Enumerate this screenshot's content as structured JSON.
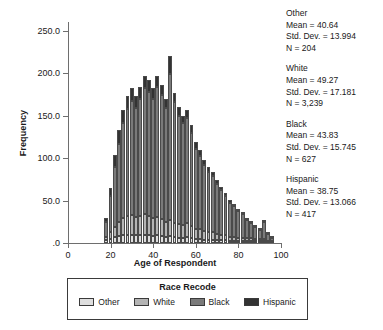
{
  "chart_data": {
    "type": "bar",
    "subtype": "stacked-histogram",
    "title": "",
    "xlabel": "Age of Respondent",
    "ylabel": "Frequency",
    "xlim": [
      0,
      100
    ],
    "ylim": [
      0,
      260
    ],
    "grid": false,
    "legend_position": "bottom",
    "legend_title": "Race Recode",
    "xticks": [
      "0",
      "20",
      "40",
      "60",
      "80",
      "100"
    ],
    "xtick_values": [
      0,
      20,
      40,
      60,
      80,
      100
    ],
    "yticks": [
      ".0",
      "50.0",
      "100.0",
      "150.0",
      "200.0",
      "250.0"
    ],
    "ytick_values": [
      0,
      50,
      100,
      150,
      200,
      250
    ],
    "series_order": [
      "Other",
      "White",
      "Black",
      "Hispanic"
    ],
    "series": [
      {
        "name": "Other",
        "color": "#dedede",
        "values": [
          3,
          5,
          7,
          8,
          9,
          10,
          10,
          9,
          9,
          10,
          9,
          8,
          9,
          8,
          7,
          8,
          7,
          6,
          6,
          7,
          6,
          5,
          5,
          4,
          4,
          4,
          3,
          3,
          3,
          2,
          2,
          2,
          2,
          1,
          1,
          1,
          1,
          1,
          0,
          0
        ]
      },
      {
        "name": "White",
        "color": "#b4b4b4",
        "values": [
          4,
          8,
          12,
          17,
          20,
          22,
          23,
          22,
          23,
          24,
          23,
          21,
          22,
          20,
          18,
          19,
          17,
          16,
          15,
          16,
          14,
          12,
          11,
          10,
          9,
          9,
          8,
          7,
          6,
          5,
          5,
          4,
          4,
          3,
          3,
          2,
          2,
          2,
          1,
          1
        ]
      },
      {
        "name": "Black",
        "color": "#7a7a7a",
        "values": [
          18,
          42,
          70,
          92,
          112,
          126,
          134,
          128,
          138,
          148,
          146,
          140,
          152,
          146,
          134,
          172,
          142,
          128,
          120,
          124,
          110,
          94,
          86,
          78,
          70,
          66,
          58,
          52,
          46,
          40,
          36,
          31,
          28,
          22,
          18,
          14,
          11,
          20,
          8,
          4
        ]
      },
      {
        "name": "Hispanic",
        "color": "#333333",
        "values": [
          5,
          10,
          14,
          16,
          16,
          15,
          15,
          14,
          14,
          15,
          14,
          13,
          14,
          12,
          11,
          21,
          11,
          10,
          9,
          10,
          9,
          8,
          7,
          6,
          6,
          5,
          5,
          4,
          4,
          3,
          3,
          3,
          2,
          2,
          2,
          1,
          1,
          2,
          1,
          1
        ]
      }
    ],
    "bin_centers": [
      17.5,
      19.5,
      21.5,
      23.5,
      25.5,
      27.5,
      29.5,
      31.5,
      33.5,
      35.5,
      37.5,
      39.5,
      41.5,
      43.5,
      45.5,
      47.5,
      49.5,
      51.5,
      53.5,
      55.5,
      57.5,
      59.5,
      61.5,
      63.5,
      65.5,
      67.5,
      69.5,
      71.5,
      73.5,
      75.5,
      77.5,
      79.5,
      81.5,
      83.5,
      85.5,
      87.5,
      89.5,
      91.5,
      93.5,
      95.5
    ],
    "bin_width": 1.8,
    "annotations": [
      {
        "group": "Other",
        "mean_label": "Mean = 40.64",
        "sd_label": "Std. Dev. = 13.994",
        "n_label": "N = 204",
        "mean": 40.64,
        "std_dev": 13.994,
        "n": 204
      },
      {
        "group": "White",
        "mean_label": "Mean = 49.27",
        "sd_label": "Std. Dev. = 17.181",
        "n_label": "N = 3,239",
        "mean": 49.27,
        "std_dev": 17.181,
        "n": 3239
      },
      {
        "group": "Black",
        "mean_label": "Mean = 43.83",
        "sd_label": "Std. Dev. = 15.745",
        "n_label": "N = 627",
        "mean": 43.83,
        "std_dev": 15.745,
        "n": 627
      },
      {
        "group": "Hispanic",
        "mean_label": "Mean = 38.75",
        "sd_label": "Std. Dev. = 13.066",
        "n_label": "N = 417",
        "mean": 38.75,
        "std_dev": 13.066,
        "n": 417
      }
    ]
  }
}
